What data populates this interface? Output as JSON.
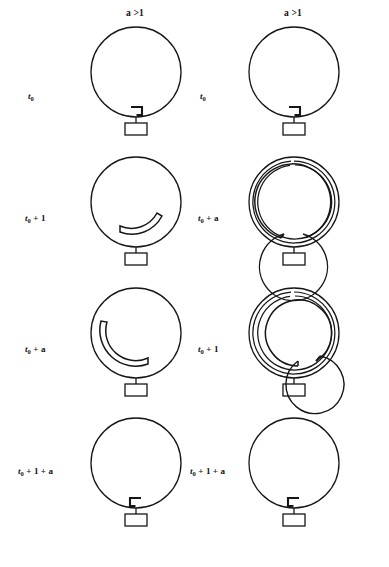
{
  "figure": {
    "caption": "",
    "line_color": "#161616",
    "background": "#ffffff"
  },
  "columns": [
    {
      "id": "left",
      "header": "a >1",
      "header_x": 135,
      "rows": [
        {
          "label_text": "t0",
          "label_main": "t",
          "label_sub": "0",
          "label_rest": "",
          "state": "unreplicated",
          "marker": "hook-left"
        },
        {
          "label_text": "t0 + 1",
          "label_main": "t",
          "label_sub": "0",
          "label_rest": " + 1",
          "state": "short-arc",
          "marker": "arc-short"
        },
        {
          "label_text": "t0 + a",
          "label_main": "t",
          "label_sub": "0",
          "label_rest": " + a",
          "state": "long-arc",
          "marker": "arc-long"
        },
        {
          "label_text": "t0 + 1 + a",
          "label_main": "t",
          "label_sub": "0",
          "label_rest": " + 1 + a",
          "state": "unreplicated",
          "marker": "hook-right"
        }
      ]
    },
    {
      "id": "right",
      "header": "a >1",
      "header_x": 293,
      "rows": [
        {
          "label_text": "t0",
          "label_main": "t",
          "label_sub": "0",
          "label_rest": "",
          "state": "unreplicated",
          "marker": "hook-left"
        },
        {
          "label_text": "t0 + a",
          "label_main": "t",
          "label_sub": "0",
          "label_rest": " + a",
          "state": "multifork-spiral",
          "marker": "spiral-gap-bottom"
        },
        {
          "label_text": "t0 + 1",
          "label_main": "t",
          "label_sub": "0",
          "label_rest": " + 1",
          "state": "multifork-spiral",
          "marker": "spiral-gap-lower-right"
        },
        {
          "label_text": "t0 + 1 + a",
          "label_main": "t",
          "label_sub": "0",
          "label_rest": " + 1 + a",
          "state": "unreplicated",
          "marker": "hook-right"
        }
      ]
    }
  ],
  "row_label_positions": [
    {
      "left_x": 28,
      "right_x": 200,
      "y": 96
    },
    {
      "left_x": 25,
      "right_x": 198,
      "y": 218
    },
    {
      "left_x": 25,
      "right_x": 198,
      "y": 349
    },
    {
      "left_x": 18,
      "right_x": 190,
      "y": 471
    }
  ],
  "cell_positions": [
    {
      "left_x": 88,
      "right_x": 246,
      "y": 22
    },
    {
      "left_x": 88,
      "right_x": 246,
      "y": 152
    },
    {
      "left_x": 88,
      "right_x": 246,
      "y": 283
    },
    {
      "left_x": 88,
      "right_x": 246,
      "y": 413
    }
  ],
  "geometry": {
    "circle_radius": 45,
    "circle_cx": 48,
    "circle_cy": 50,
    "stem_length": 16,
    "box_width": 22,
    "box_height": 12,
    "stroke_width": 1.3
  }
}
